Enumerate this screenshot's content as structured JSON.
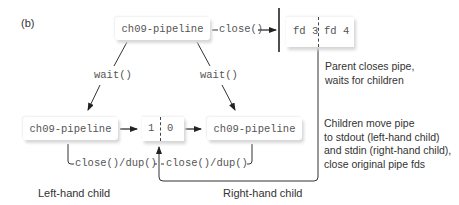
{
  "figure_label": "(b)",
  "parent": {
    "process_label": "ch09-pipeline",
    "close_label": "close()",
    "pipe_fds": [
      "fd 3",
      "fd 4"
    ],
    "note_lines": [
      "Parent closes pipe,",
      "waits for children"
    ]
  },
  "wait_labels": [
    "wait()",
    "wait()"
  ],
  "children": {
    "left": {
      "process_label": "ch09-pipeline",
      "action_label": "close()/dup()",
      "caption": "Left-hand child"
    },
    "right": {
      "process_label": "ch09-pipeline",
      "action_label": "close()/dup()",
      "caption": "Right-hand child"
    },
    "pipe_fds": [
      "1",
      "0"
    ],
    "note_lines": [
      "Children move pipe",
      "to stdout (left-hand child)",
      "and stdin (right-hand child),",
      "close original pipe fds"
    ]
  },
  "colors": {
    "line": "#333333",
    "box_shadow": "#d8d8d8",
    "mono_text": "#555555"
  }
}
